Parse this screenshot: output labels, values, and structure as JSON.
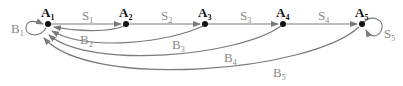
{
  "diagram": {
    "type": "state-transition",
    "nodes": [
      {
        "id": "A1",
        "letter": "A",
        "sub": "1",
        "x": 48,
        "y": 24
      },
      {
        "id": "A2",
        "letter": "A",
        "sub": "2",
        "x": 126,
        "y": 24
      },
      {
        "id": "A3",
        "letter": "A",
        "sub": "3",
        "x": 205,
        "y": 24
      },
      {
        "id": "A4",
        "letter": "A",
        "sub": "4",
        "x": 283,
        "y": 24
      },
      {
        "id": "A5",
        "letter": "A",
        "sub": "5",
        "x": 362,
        "y": 24
      }
    ],
    "edges": [
      {
        "id": "S1",
        "letter": "S",
        "sub": "1",
        "from": "A1",
        "to": "A2"
      },
      {
        "id": "S2",
        "letter": "S",
        "sub": "2",
        "from": "A2",
        "to": "A3"
      },
      {
        "id": "S3",
        "letter": "S",
        "sub": "3",
        "from": "A3",
        "to": "A4"
      },
      {
        "id": "S4",
        "letter": "S",
        "sub": "4",
        "from": "A4",
        "to": "A5"
      },
      {
        "id": "S5",
        "letter": "S",
        "sub": "5",
        "from": "A5",
        "to": "A5"
      },
      {
        "id": "B1",
        "letter": "B",
        "sub": "1",
        "from": "A1",
        "to": "A1"
      },
      {
        "id": "B2",
        "letter": "B",
        "sub": "2",
        "from": "A2",
        "to": "A1"
      },
      {
        "id": "B3",
        "letter": "B",
        "sub": "3",
        "from": "A3",
        "to": "A1"
      },
      {
        "id": "B4",
        "letter": "B",
        "sub": "4",
        "from": "A4",
        "to": "A1"
      },
      {
        "id": "B5",
        "letter": "B",
        "sub": "5",
        "from": "A5",
        "to": "A1"
      }
    ],
    "colors": {
      "node": "#111111",
      "edge": "#7a7a7a",
      "edge_label": "#8a8a8a"
    }
  },
  "labels": {
    "A1": {
      "l": "A",
      "s": "1"
    },
    "A2": {
      "l": "A",
      "s": "2"
    },
    "A3": {
      "l": "A",
      "s": "3"
    },
    "A4": {
      "l": "A",
      "s": "4"
    },
    "A5": {
      "l": "A",
      "s": "5"
    },
    "S1": {
      "l": "S",
      "s": "1"
    },
    "S2": {
      "l": "S",
      "s": "2"
    },
    "S3": {
      "l": "S",
      "s": "3"
    },
    "S4": {
      "l": "S",
      "s": "4"
    },
    "S5": {
      "l": "S",
      "s": "5"
    },
    "B1": {
      "l": "B",
      "s": "1"
    },
    "B2": {
      "l": "B",
      "s": "2"
    },
    "B3": {
      "l": "B",
      "s": "3"
    },
    "B4": {
      "l": "B",
      "s": "4"
    },
    "B5": {
      "l": "B",
      "s": "5"
    }
  }
}
